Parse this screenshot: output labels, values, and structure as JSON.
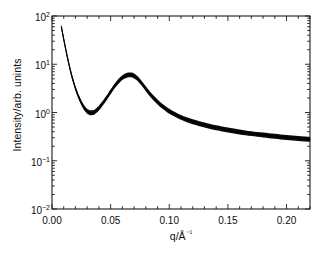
{
  "chart_data": {
    "type": "line",
    "title": "",
    "xlabel": "q/Å⁻¹",
    "ylabel": "Intensity/arb. unints",
    "xscale": "linear",
    "yscale": "log",
    "xlim": [
      0.0,
      0.22
    ],
    "ylim": [
      0.01,
      100
    ],
    "grid": false,
    "legend": null,
    "xticks": [
      0.0,
      0.05,
      0.1,
      0.15,
      0.2
    ],
    "xtick_labels": [
      "0.00",
      "0.05",
      "0.10",
      "0.15",
      "0.20"
    ],
    "xminor_ticks": [
      0.01,
      0.02,
      0.03,
      0.04,
      0.06,
      0.07,
      0.08,
      0.09,
      0.11,
      0.12,
      0.13,
      0.14,
      0.16,
      0.17,
      0.18,
      0.19,
      0.21,
      0.22
    ],
    "yticks": [
      0.01,
      0.1,
      1,
      10,
      100
    ],
    "ytick_labels": [
      "10⁻²",
      "10⁻¹",
      "10⁰",
      "10¹",
      "10²"
    ],
    "ytick_mantissas": [
      "10",
      "10",
      "10",
      "10",
      "10"
    ],
    "ytick_exponents": [
      "-2",
      "-1",
      "0",
      "1",
      "2"
    ],
    "series": [
      {
        "name": "Intensity band",
        "style": "thick black band of overlapping curves",
        "color": "#0a0a0a",
        "x": [
          0.008,
          0.009,
          0.01,
          0.011,
          0.012,
          0.013,
          0.014,
          0.015,
          0.016,
          0.017,
          0.018,
          0.019,
          0.02,
          0.021,
          0.022,
          0.023,
          0.024,
          0.025,
          0.026,
          0.027,
          0.028,
          0.029,
          0.03,
          0.031,
          0.032,
          0.033,
          0.034,
          0.035,
          0.036,
          0.037,
          0.038,
          0.039,
          0.04,
          0.042,
          0.044,
          0.046,
          0.048,
          0.05,
          0.052,
          0.054,
          0.056,
          0.058,
          0.06,
          0.062,
          0.064,
          0.066,
          0.067,
          0.068,
          0.07,
          0.072,
          0.074,
          0.076,
          0.078,
          0.08,
          0.083,
          0.086,
          0.09,
          0.094,
          0.098,
          0.102,
          0.106,
          0.11,
          0.115,
          0.12,
          0.125,
          0.13,
          0.135,
          0.14,
          0.145,
          0.15,
          0.155,
          0.16,
          0.165,
          0.17,
          0.175,
          0.18,
          0.185,
          0.19,
          0.195,
          0.2,
          0.205,
          0.21,
          0.215,
          0.22
        ],
        "y": [
          60.0,
          44.0,
          33.0,
          25.0,
          19.0,
          14.5,
          11.2,
          8.8,
          7.0,
          5.6,
          4.6,
          3.8,
          3.2,
          2.72,
          2.34,
          2.04,
          1.8,
          1.6,
          1.44,
          1.31,
          1.21,
          1.13,
          1.07,
          1.03,
          1.005,
          0.995,
          0.995,
          1.0,
          1.02,
          1.06,
          1.11,
          1.17,
          1.24,
          1.42,
          1.65,
          1.93,
          2.28,
          2.7,
          3.18,
          3.7,
          4.25,
          4.8,
          5.3,
          5.7,
          5.96,
          6.05,
          6.05,
          6.0,
          5.75,
          5.3,
          4.75,
          4.18,
          3.62,
          3.12,
          2.52,
          2.08,
          1.66,
          1.36,
          1.15,
          1.0,
          0.885,
          0.795,
          0.71,
          0.645,
          0.595,
          0.552,
          0.515,
          0.485,
          0.458,
          0.435,
          0.414,
          0.396,
          0.38,
          0.366,
          0.353,
          0.342,
          0.332,
          0.322,
          0.313,
          0.305,
          0.298,
          0.291,
          0.285,
          0.28
        ],
        "y_upper": [
          68.0,
          50.0,
          37.0,
          28.0,
          21.2,
          16.2,
          12.5,
          9.8,
          7.8,
          6.25,
          5.12,
          4.24,
          3.56,
          3.03,
          2.61,
          2.28,
          2.01,
          1.79,
          1.61,
          1.465,
          1.355,
          1.265,
          1.195,
          1.15,
          1.12,
          1.11,
          1.11,
          1.12,
          1.14,
          1.185,
          1.24,
          1.31,
          1.385,
          1.59,
          1.845,
          2.16,
          2.55,
          3.02,
          3.56,
          4.14,
          4.76,
          5.37,
          5.93,
          6.38,
          6.67,
          6.77,
          6.77,
          6.72,
          6.44,
          5.93,
          5.32,
          4.68,
          4.05,
          3.49,
          2.82,
          2.33,
          1.86,
          1.52,
          1.29,
          1.12,
          0.99,
          0.89,
          0.795,
          0.722,
          0.666,
          0.618,
          0.576,
          0.543,
          0.513,
          0.487,
          0.464,
          0.443,
          0.425,
          0.41,
          0.395,
          0.383,
          0.372,
          0.361,
          0.351,
          0.342,
          0.334,
          0.326,
          0.319,
          0.314
        ],
        "y_lower": [
          53.0,
          39.0,
          29.2,
          22.1,
          16.8,
          12.8,
          9.9,
          7.8,
          6.2,
          4.95,
          4.07,
          3.36,
          2.83,
          2.41,
          2.07,
          1.8,
          1.59,
          1.42,
          1.275,
          1.16,
          1.07,
          1.0,
          0.947,
          0.912,
          0.89,
          0.881,
          0.881,
          0.886,
          0.903,
          0.939,
          0.983,
          1.036,
          1.098,
          1.258,
          1.461,
          1.709,
          2.02,
          2.39,
          2.82,
          3.28,
          3.77,
          4.25,
          4.7,
          5.05,
          5.28,
          5.36,
          5.36,
          5.32,
          5.09,
          4.69,
          4.21,
          3.7,
          3.21,
          2.76,
          2.23,
          1.84,
          1.47,
          1.205,
          1.018,
          0.886,
          0.784,
          0.704,
          0.629,
          0.571,
          0.527,
          0.489,
          0.456,
          0.43,
          0.406,
          0.385,
          0.367,
          0.351,
          0.337,
          0.324,
          0.313,
          0.303,
          0.294,
          0.285,
          0.277,
          0.27,
          0.264,
          0.258,
          0.252,
          0.248
        ]
      }
    ],
    "annotations": []
  },
  "axes": {
    "frame_color": "#1a1a1a",
    "tick_color": "#1a1a1a",
    "background": "#ffffff"
  }
}
